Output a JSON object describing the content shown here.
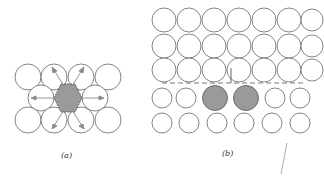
{
  "panels": [
    {
      "id": "a",
      "label": "(a)",
      "description": "hexagonal close-packed atoms around a shaded interstitial region with outward arrows"
    },
    {
      "id": "b",
      "label": "(b)",
      "description": "square array of atoms with a dashed slip plane and two shaded atoms"
    }
  ],
  "colors": {
    "circle_stroke": "#666666",
    "shaded_fill": "#9a9a9a",
    "arrow": "#888888",
    "dashed_line": "#777777"
  }
}
